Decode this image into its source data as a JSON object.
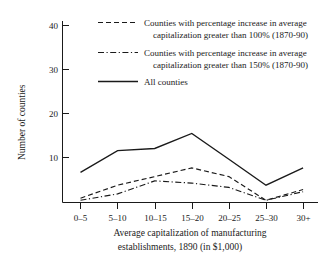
{
  "chart_data": {
    "type": "line",
    "title": "",
    "xlabel": "Average capitalization of manufacturing establishments, 1890 (in $1,000)",
    "xlabel_line1": "Average capitalization of manufacturing",
    "xlabel_line2": "establishments, 1890 (in $1,000)",
    "ylabel": "Number of counties",
    "categories": [
      "0–5",
      "5–10",
      "10–15",
      "15–20",
      "20–25",
      "25–30",
      "30+"
    ],
    "ylim": [
      0,
      42
    ],
    "yticks": [
      10,
      20,
      30,
      40
    ],
    "ytick_labels": [
      "10",
      "20",
      "30",
      "40"
    ],
    "grid": false,
    "legend_position": "top-right",
    "series": [
      {
        "name": "Counties with percentage increase in average capitalization greater than 100% (1870-90)",
        "style": "dashed",
        "values": [
          1,
          4,
          6,
          8,
          6,
          0.5,
          3
        ]
      },
      {
        "name": "Counties with percentage increase in average capitalization greater than 150% (1870-90)",
        "style": "dash-dot",
        "values": [
          0.5,
          2,
          5,
          4.5,
          3.5,
          0.5,
          2.5
        ]
      },
      {
        "name": "All counties",
        "style": "solid",
        "values": [
          7,
          12,
          12.5,
          16,
          10,
          4,
          8
        ]
      }
    ]
  },
  "legend": {
    "entries": [
      {
        "style": "dashed",
        "line1": "Counties with percentage increase in average",
        "line2": "capitalization greater than 100% (1870-90)"
      },
      {
        "style": "dash-dot",
        "line1": "Counties with percentage increase in average",
        "line2": "capitalization greater than 150% (1870-90)"
      },
      {
        "style": "solid",
        "line1": "All counties",
        "line2": ""
      }
    ]
  },
  "axes": {
    "y_title": "Number of counties",
    "x_title_line1": "Average capitalization of manufacturing",
    "x_title_line2": "establishments, 1890 (in $1,000)",
    "y_ticks": [
      "10",
      "20",
      "30",
      "40"
    ],
    "x_ticks": [
      "0–5",
      "5–10",
      "10–15",
      "15–20",
      "20–25",
      "25–30",
      "30+"
    ]
  },
  "colors": {
    "ink": "#1a1a1a",
    "background": "#ffffff"
  }
}
